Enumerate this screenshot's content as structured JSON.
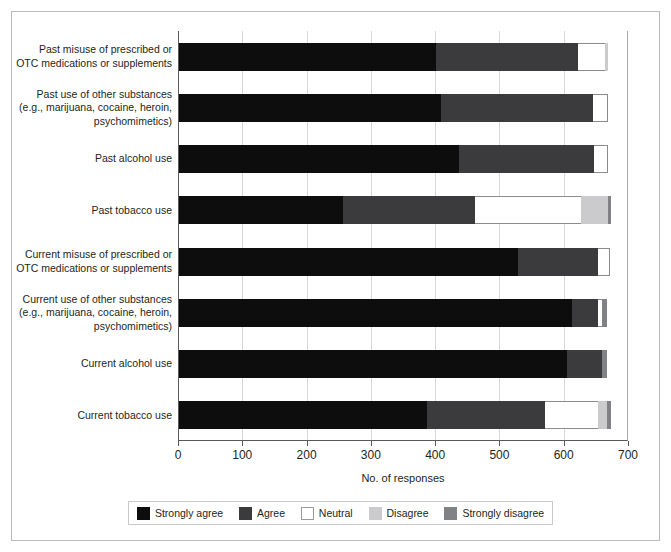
{
  "chart_data": {
    "type": "bar",
    "orientation": "horizontal",
    "stacked": true,
    "title": "",
    "xlabel": "No. of responses",
    "ylabel": "",
    "xlim": [
      0,
      700
    ],
    "xticks": [
      0,
      100,
      200,
      300,
      400,
      500,
      600,
      700
    ],
    "xtick_labels": [
      "0",
      "100",
      "200",
      "300",
      "400",
      "500",
      "600",
      "700"
    ],
    "grid": "vertical",
    "legend_position": "bottom",
    "categories": [
      "Past misuse of prescribed or OTC medications or supplements",
      "Past use of other substances (e.g., marijuana, cocaine, heroin, psychomimetics)",
      "Past alcohol use",
      "Past tobacco use",
      "Current misuse of prescribed or OTC medications or supplements",
      "Current use of other substances (e.g., marijuana, cocaine, heroin, psychomimetics)",
      "Current alcohol use",
      "Current tobacco use"
    ],
    "category_lines": [
      [
        "Past misuse of prescribed or",
        "OTC medications or supplements"
      ],
      [
        "Past use of other substances",
        "(e.g., marijuana, cocaine, heroin,",
        "psychomimetics)"
      ],
      [
        "Past alcohol use"
      ],
      [
        "Past tobacco use"
      ],
      [
        "Current misuse of prescribed or",
        "OTC medications or supplements"
      ],
      [
        "Current use of other substances",
        "(e.g., marijuana, cocaine, heroin,",
        "psychomimetics)"
      ],
      [
        "Current alcohol use"
      ],
      [
        "Current tobacco use"
      ]
    ],
    "series": [
      {
        "name": "Strongly agree",
        "color": "#0d0d0d",
        "values": [
          401,
          409,
          437,
          257,
          529,
          613,
          605,
          387
        ]
      },
      {
        "name": "Agree",
        "color": "#3b3b3d",
        "values": [
          221,
          236,
          210,
          205,
          125,
          40,
          55,
          184
        ]
      },
      {
        "name": "Neutral",
        "color": "#ffffff",
        "values": [
          42,
          24,
          22,
          165,
          18,
          7,
          0,
          82
        ]
      },
      {
        "name": "Disagree",
        "color": "#cbcbcd",
        "values": [
          5,
          0,
          0,
          42,
          0,
          0,
          0,
          15
        ]
      },
      {
        "name": "Strongly disagree",
        "color": "#808285",
        "values": [
          0,
          0,
          0,
          5,
          0,
          8,
          8,
          5
        ]
      }
    ],
    "row_totals": [
      669,
      669,
      669,
      674,
      672,
      668,
      668,
      673
    ]
  },
  "legend": {
    "items": [
      {
        "label": "Strongly agree",
        "swatch": "swatch-strongly-agree"
      },
      {
        "label": "Agree",
        "swatch": "swatch-agree"
      },
      {
        "label": "Neutral",
        "swatch": "swatch-neutral"
      },
      {
        "label": "Disagree",
        "swatch": "swatch-disagree"
      },
      {
        "label": "Strongly disagree",
        "swatch": "swatch-strongly-disagree"
      }
    ]
  }
}
